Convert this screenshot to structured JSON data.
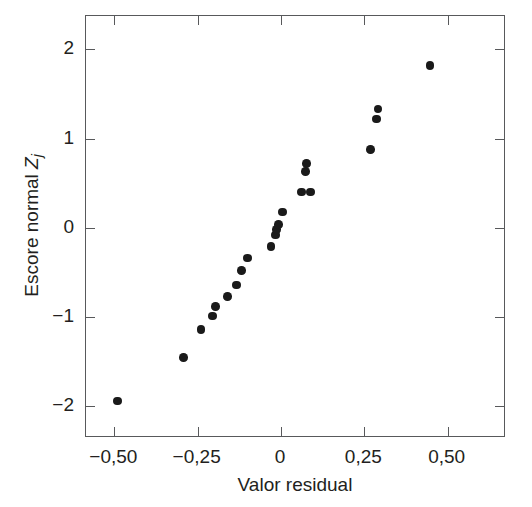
{
  "chart_data": {
    "type": "scatter",
    "title": "",
    "xlabel": "Valor residual",
    "ylabel_text": "Escore normal ",
    "ylabel_var": "Z",
    "ylabel_sub": "j",
    "xlim": [
      -0.585,
      0.675
    ],
    "ylim": [
      -2.355,
      2.375
    ],
    "grid": false,
    "legend": null,
    "xticks": [
      -0.5,
      -0.25,
      0,
      0.25,
      0.5
    ],
    "xticklabels": [
      "−0,50",
      "−0,25",
      "0",
      "0,25",
      "0,50"
    ],
    "yticks": [
      -2,
      -1,
      0,
      1,
      2
    ],
    "yticklabels": [
      "−2",
      "−1",
      "0",
      "1",
      "2"
    ],
    "marker": "circle",
    "marker_color": "#1a1a1a",
    "marker_size_px": 8.5,
    "axis_color": "#58595b",
    "background": "#ffffff",
    "n_points": 22,
    "points": [
      {
        "x": -0.49,
        "y": -1.94
      },
      {
        "x": -0.292,
        "y": -1.45
      },
      {
        "x": -0.24,
        "y": -1.14
      },
      {
        "x": -0.205,
        "y": -0.99
      },
      {
        "x": -0.197,
        "y": -0.88
      },
      {
        "x": -0.16,
        "y": -0.77
      },
      {
        "x": -0.133,
        "y": -0.64
      },
      {
        "x": -0.118,
        "y": -0.48
      },
      {
        "x": -0.1,
        "y": -0.34
      },
      {
        "x": -0.03,
        "y": -0.21
      },
      {
        "x": -0.017,
        "y": -0.08
      },
      {
        "x": -0.014,
        "y": -0.02
      },
      {
        "x": -0.008,
        "y": 0.04
      },
      {
        "x": 0.005,
        "y": 0.18
      },
      {
        "x": 0.062,
        "y": 0.4
      },
      {
        "x": 0.088,
        "y": 0.4
      },
      {
        "x": 0.073,
        "y": 0.63
      },
      {
        "x": 0.076,
        "y": 0.72
      },
      {
        "x": 0.268,
        "y": 0.88
      },
      {
        "x": 0.287,
        "y": 1.22
      },
      {
        "x": 0.291,
        "y": 1.33
      },
      {
        "x": 0.447,
        "y": 1.82
      }
    ]
  }
}
